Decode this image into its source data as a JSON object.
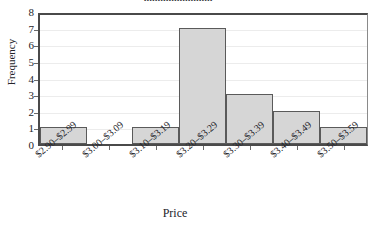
{
  "chart_data": {
    "type": "bar",
    "title": "",
    "xlabel": "Price",
    "ylabel": "Frequency",
    "categories": [
      "$2.90–$2.99",
      "$3.00–$3.09",
      "$3.10–$3.19",
      "$3.20–$3.29",
      "$3.30–$3.39",
      "$3.40–$3.49",
      "$3.50–$3.59"
    ],
    "values": [
      1,
      0,
      1,
      7,
      3,
      2,
      1
    ],
    "yticks": [
      "0",
      "1",
      "2",
      "3",
      "4",
      "5",
      "6",
      "7",
      "8"
    ],
    "ylim": [
      0,
      8
    ],
    "grid": true,
    "legend": null,
    "bar_fill": "#d6d6d6",
    "bar_edge": "#5a5a5a",
    "grid_color": "#ececec",
    "axis_color": "#4a4a4a"
  },
  "figure": {
    "title_clipped": "........................."
  }
}
